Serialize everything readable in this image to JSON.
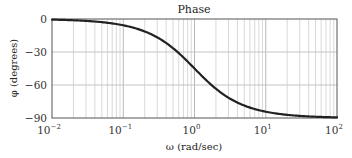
{
  "chart_data": {
    "type": "line",
    "title": "Phase",
    "xlabel": "ω (rad/sec)",
    "ylabel": "φ (degrees)",
    "xscale": "log",
    "xlim": [
      0.01,
      100
    ],
    "ylim": [
      -90,
      0
    ],
    "grid": true,
    "legend": "none",
    "x_ticks": [
      {
        "value": 0.01,
        "base": "10",
        "exp": "−2"
      },
      {
        "value": 0.1,
        "base": "10",
        "exp": "−1"
      },
      {
        "value": 1,
        "base": "10",
        "exp": "0"
      },
      {
        "value": 10,
        "base": "10",
        "exp": "1"
      },
      {
        "value": 100,
        "base": "10",
        "exp": "2"
      }
    ],
    "y_ticks": [
      {
        "value": 0,
        "label": "0"
      },
      {
        "value": -30,
        "label": "−30"
      },
      {
        "value": -60,
        "label": "−60"
      },
      {
        "value": -90,
        "label": "−90"
      }
    ],
    "series": [
      {
        "name": "Phase",
        "color": "#222222",
        "x": [
          0.01,
          0.02,
          0.05,
          0.1,
          0.2,
          0.3,
          0.5,
          0.7,
          1,
          1.5,
          2,
          3,
          5,
          7,
          10,
          20,
          50,
          100
        ],
        "y": [
          -0.6,
          -1.1,
          -2.9,
          -5.7,
          -11.3,
          -16.7,
          -26.6,
          -35.0,
          -45.0,
          -56.3,
          -63.4,
          -71.6,
          -78.7,
          -81.9,
          -84.3,
          -87.1,
          -88.9,
          -89.4
        ]
      }
    ]
  }
}
